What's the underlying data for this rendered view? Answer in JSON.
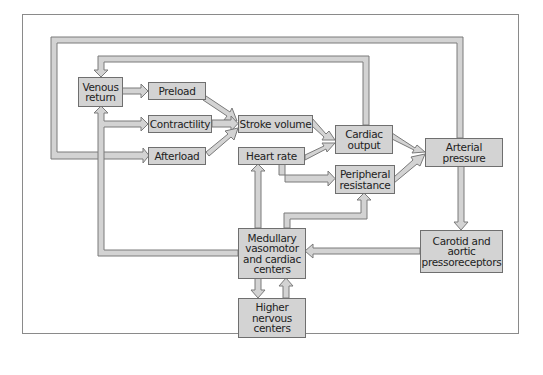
{
  "diagram": {
    "title": "",
    "colors": {
      "box_fill": "#d3d3d3",
      "box_border": "#6f6f6f",
      "arrow_fill": "#d3d3d3",
      "arrow_border": "#7a7a7a",
      "frame": "#8a8a8a",
      "text": "#222222"
    },
    "nodes": {
      "venous_return": "Venous\nreturn",
      "preload": "Preload",
      "contractility": "Contractility",
      "afterload": "Afterload",
      "stroke_volume": "Stroke volume",
      "heart_rate": "Heart rate",
      "cardiac_output": "Cardiac\noutput",
      "peripheral_resistance": "Peripheral\nresistance",
      "arterial_pressure": "Arterial\npressure",
      "medullary": "Medullary\nvasomotor\nand cardiac\ncenters",
      "higher_nervous": "Higher\nnervous\ncenters",
      "carotid": "Carotid and\naortic\npressoreceptors"
    },
    "edges": [
      {
        "from": "Venous return",
        "to": "Preload"
      },
      {
        "from": "Preload",
        "to": "Stroke volume"
      },
      {
        "from": "Contractility",
        "to": "Stroke volume"
      },
      {
        "from": "Afterload",
        "to": "Stroke volume"
      },
      {
        "from": "Stroke volume",
        "to": "Cardiac output"
      },
      {
        "from": "Heart rate",
        "to": "Cardiac output"
      },
      {
        "from": "Heart rate",
        "to": "Peripheral resistance"
      },
      {
        "from": "Cardiac output",
        "to": "Arterial pressure"
      },
      {
        "from": "Peripheral resistance",
        "to": "Arterial pressure"
      },
      {
        "from": "Cardiac output",
        "to": "Venous return"
      },
      {
        "from": "Arterial pressure",
        "to": "Afterload"
      },
      {
        "from": "Arterial pressure",
        "to": "Carotid and aortic pressoreceptors"
      },
      {
        "from": "Carotid and aortic pressoreceptors",
        "to": "Medullary vasomotor and cardiac centers"
      },
      {
        "from": "Medullary vasomotor and cardiac centers",
        "to": "Heart rate"
      },
      {
        "from": "Medullary vasomotor and cardiac centers",
        "to": "Peripheral resistance"
      },
      {
        "from": "Medullary vasomotor and cardiac centers",
        "to": "Venous return"
      },
      {
        "from": "Medullary vasomotor and cardiac centers",
        "to": "Contractility"
      },
      {
        "from": "Medullary vasomotor and cardiac centers",
        "to": "Higher nervous centers"
      },
      {
        "from": "Higher nervous centers",
        "to": "Medullary vasomotor and cardiac centers"
      }
    ]
  }
}
